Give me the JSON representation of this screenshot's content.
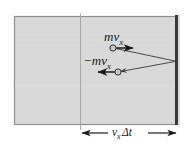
{
  "figure": {
    "colors": {
      "gas_fill": "#d9d9d9",
      "box_border": "#8f8f8f",
      "wall": "#3a3a3a",
      "divider": "#a9a9a9",
      "vector": "#1b1b1b",
      "trajectory": "#4a4a4a",
      "particle_fill": "#c8c8c8",
      "particle_stroke": "#2b2b2b",
      "background": "#ffffff"
    },
    "box": {
      "x": 14,
      "y": 16,
      "width": 164,
      "height": 109
    },
    "divider_x": 80,
    "wall_x": 176,
    "labels": {
      "incoming_momentum": "mv",
      "incoming_momentum_sub": "x",
      "outgoing_momentum": "−mv",
      "outgoing_momentum_sub": "x",
      "distance": "v",
      "distance_sub": "x",
      "distance_suffix": "Δt"
    },
    "particles": [
      {
        "name": "incoming-particle",
        "cx": 113,
        "cy": 48,
        "r": 3.1
      },
      {
        "name": "outgoing-particle",
        "cx": 118,
        "cy": 72,
        "r": 3.1
      }
    ],
    "vectors": [
      {
        "name": "incoming-momentum-vector",
        "x1": 113,
        "y1": 48,
        "x2": 136,
        "y2": 48,
        "direction": "right"
      },
      {
        "name": "outgoing-momentum-vector",
        "x1": 118,
        "y1": 72,
        "x2": 94,
        "y2": 72,
        "direction": "left"
      }
    ],
    "trajectory": {
      "impact_x": 176,
      "impact_y": 61,
      "incoming_from": {
        "x": 113,
        "y": 48
      },
      "outgoing_to": {
        "x": 118,
        "y": 72
      }
    },
    "dimension": {
      "y": 133,
      "x_start": 80,
      "x_end": 178
    }
  }
}
